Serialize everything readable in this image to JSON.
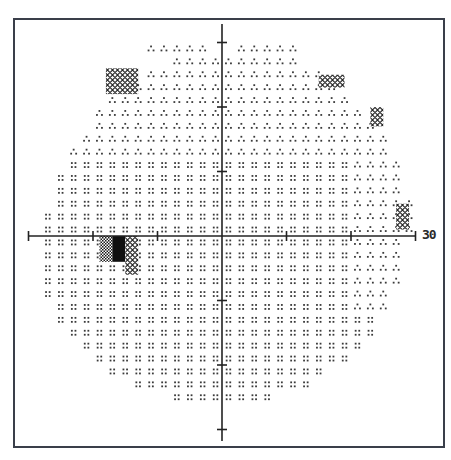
{
  "chart_data": {
    "type": "heatmap",
    "title": "",
    "xlabel": "",
    "ylabel": "",
    "axis_end_label": "30",
    "xlim": [
      -30,
      30
    ],
    "ylim": [
      -30,
      30
    ],
    "tick_interval_deg": 10,
    "grid": false,
    "legend": null,
    "center_px": [
      222,
      236
    ],
    "px_per_10deg": 64.5,
    "grayscale_levels": [
      "blank",
      "sparse-dots",
      "dots",
      "triangle-dots",
      "diamond-hatch",
      "checker",
      "solid"
    ],
    "regions": [
      {
        "name": "superior-temporal-patch",
        "pattern": "diamond-hatch",
        "x_deg": [
          -18,
          -13
        ],
        "y_deg": [
          22,
          26
        ]
      },
      {
        "name": "superior-nasal-patch",
        "pattern": "diamond-hatch",
        "x_deg": [
          15,
          19
        ],
        "y_deg": [
          23,
          25
        ]
      },
      {
        "name": "nasal-edge-patch-1",
        "pattern": "diamond-hatch",
        "x_deg": [
          23,
          25
        ],
        "y_deg": [
          17,
          20
        ]
      },
      {
        "name": "nasal-edge-patch-2",
        "pattern": "diamond-hatch",
        "x_deg": [
          27,
          29
        ],
        "y_deg": [
          1,
          5
        ]
      },
      {
        "name": "blind-spot-scotoma-checker",
        "pattern": "checker",
        "x_deg": [
          -19,
          -17
        ],
        "y_deg": [
          -4,
          0
        ]
      },
      {
        "name": "blind-spot-scotoma-solid",
        "pattern": "solid",
        "x_deg": [
          -17,
          -15
        ],
        "y_deg": [
          -4,
          0
        ]
      },
      {
        "name": "blind-spot-scotoma-hatch",
        "pattern": "diamond-hatch",
        "x_deg": [
          -15,
          -13
        ],
        "y_deg": [
          -6,
          0
        ]
      },
      {
        "name": "superior-triangle-zone",
        "pattern": "triangle-dots",
        "y_deg": [
          12,
          30
        ]
      },
      {
        "name": "nasal-triangle-zone",
        "pattern": "triangle-dots",
        "x_deg": [
          20,
          30
        ],
        "y_deg": [
          -12,
          12
        ]
      }
    ]
  },
  "axis": {
    "end_label": "30"
  }
}
